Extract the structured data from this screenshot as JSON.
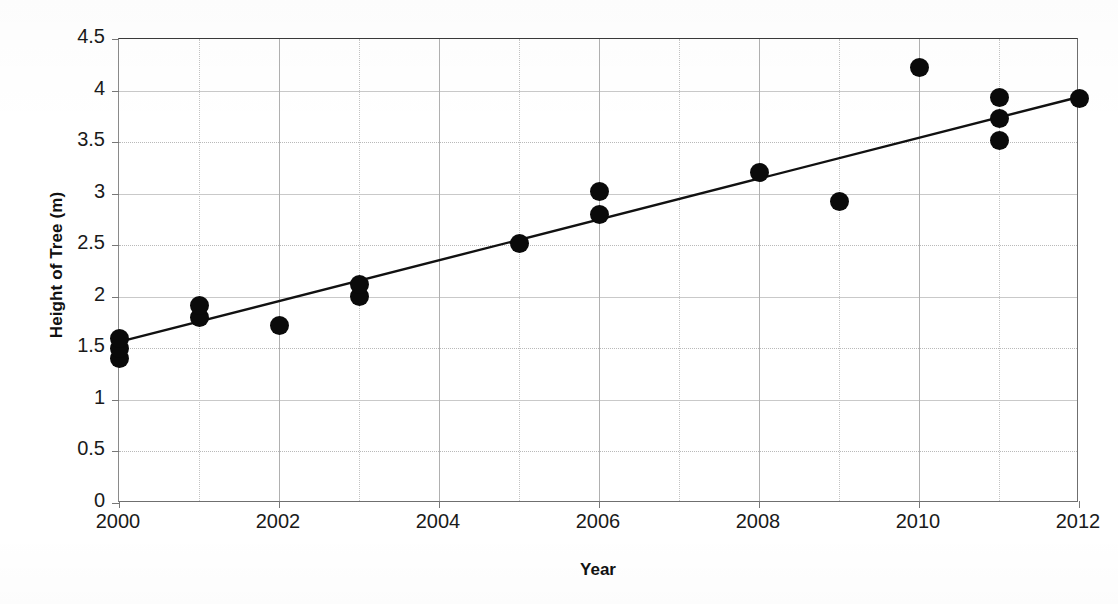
{
  "figure": {
    "background_color": "#ffffff",
    "marker_color": "#0a0a0a",
    "trendline_color": "#111111",
    "gridline_color": "#b9b9b9",
    "title_clipped": ""
  },
  "axes": {
    "x_label": "Year",
    "y_label": "Height of Tree (m)",
    "x_ticks": [
      "2000",
      "2002",
      "2004",
      "2006",
      "2008",
      "2010",
      "2012"
    ],
    "y_ticks": [
      "0",
      "0.5",
      "1",
      "1.5",
      "2",
      "2.5",
      "3",
      "3.5",
      "4",
      "4.5"
    ]
  },
  "chart_data": {
    "type": "scatter",
    "title": "",
    "xlabel": "Year",
    "ylabel": "Height of Tree (m)",
    "xlim": [
      2000,
      2012
    ],
    "ylim": [
      0,
      4.5
    ],
    "xticks": [
      2000,
      2002,
      2004,
      2006,
      2008,
      2010,
      2012
    ],
    "yticks": [
      0,
      0.5,
      1,
      1.5,
      2,
      2.5,
      3,
      3.5,
      4,
      4.5
    ],
    "x_minor_tick_step": 1,
    "grid": true,
    "grid_style": "dotted",
    "legend": false,
    "legend_position": "none",
    "marker_shape": "circle",
    "points": [
      {
        "x": 2000,
        "y": 1.4
      },
      {
        "x": 2000,
        "y": 1.5
      },
      {
        "x": 2000,
        "y": 1.6
      },
      {
        "x": 2001,
        "y": 1.8
      },
      {
        "x": 2001,
        "y": 1.92
      },
      {
        "x": 2002,
        "y": 1.72
      },
      {
        "x": 2003,
        "y": 2.0
      },
      {
        "x": 2003,
        "y": 2.12
      },
      {
        "x": 2005,
        "y": 2.52
      },
      {
        "x": 2006,
        "y": 2.8
      },
      {
        "x": 2006,
        "y": 3.02
      },
      {
        "x": 2008,
        "y": 3.21
      },
      {
        "x": 2009,
        "y": 2.92
      },
      {
        "x": 2010,
        "y": 4.22
      },
      {
        "x": 2011,
        "y": 3.52
      },
      {
        "x": 2011,
        "y": 3.73
      },
      {
        "x": 2011,
        "y": 3.93
      },
      {
        "x": 2012,
        "y": 3.92
      }
    ],
    "trendline": {
      "type": "linear",
      "x_start": 2000,
      "y_start": 1.55,
      "x_end": 2012,
      "y_end": 3.93
    }
  }
}
